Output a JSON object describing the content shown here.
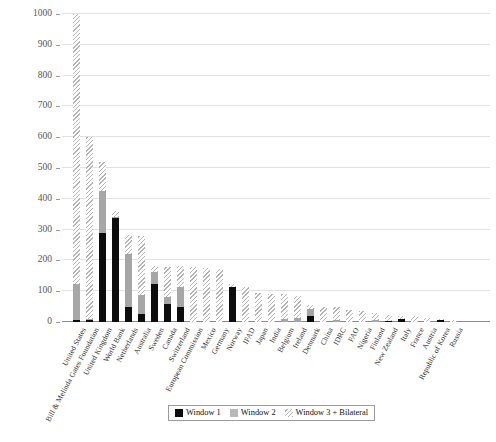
{
  "chart_data": {
    "type": "bar",
    "stacked": true,
    "title": "",
    "subtitle": "",
    "xlabel": "",
    "ylabel": "",
    "ylim": [
      0,
      1000
    ],
    "yticks": [
      0,
      100,
      200,
      300,
      400,
      500,
      600,
      700,
      800,
      900,
      1000
    ],
    "ytick_labels": [
      "0",
      "100",
      "200",
      "300",
      "400",
      "500",
      "600",
      "700",
      "800",
      "900",
      "1000"
    ],
    "grid": "horizontal",
    "legend_position": "bottom",
    "categories": [
      "United States",
      "Bill & Melinda Gates Foundation",
      "United Kingdom",
      "World Bank",
      "Netherlands",
      "Australia",
      "Sweden",
      "Canada",
      "Switzerland",
      "European Commission",
      "Mexico",
      "Germany",
      "Norway",
      "IFAD",
      "Japan",
      "India",
      "Belgium",
      "Ireland",
      "Denmark",
      "China",
      "IDRC",
      "FAO",
      "Nigeria",
      "Finland",
      "New Zealand",
      "Italy",
      "France",
      "Austria",
      "Republic of Korea",
      "Russia"
    ],
    "series": [
      {
        "name": "Window 1",
        "color": "#0d0d0d",
        "values": [
          5,
          8,
          290,
          338,
          48,
          27,
          122,
          60,
          48,
          0,
          0,
          0,
          115,
          0,
          0,
          0,
          0,
          0,
          20,
          0,
          0,
          0,
          0,
          0,
          4,
          10,
          0,
          0,
          5,
          0
        ]
      },
      {
        "name": "Window 2",
        "color": "#a6a6a6",
        "values": [
          118,
          2,
          135,
          3,
          172,
          62,
          42,
          22,
          65,
          0,
          0,
          0,
          0,
          0,
          0,
          0,
          10,
          12,
          22,
          0,
          6,
          0,
          0,
          6,
          0,
          0,
          0,
          0,
          0,
          0
        ]
      },
      {
        "name": "Window 3 + Bilateral",
        "color": "#b4b4b4",
        "hatched": true,
        "values": [
          877,
          590,
          95,
          19,
          62,
          189,
          18,
          96,
          70,
          178,
          175,
          172,
          7,
          115,
          95,
          90,
          80,
          73,
          13,
          48,
          42,
          40,
          37,
          24,
          20,
          8,
          18,
          12,
          5,
          6
        ]
      }
    ],
    "totals": [
      1000,
      600,
      520,
      360,
      282,
      278,
      182,
      178,
      183,
      178,
      175,
      172,
      122,
      115,
      95,
      90,
      90,
      85,
      55,
      48,
      48,
      40,
      37,
      30,
      24,
      18,
      18,
      12,
      10,
      6
    ]
  },
  "legend": {
    "items": [
      {
        "label": "Window 1",
        "swatch": "window-1-swatch"
      },
      {
        "label": "Window 2",
        "swatch": "window-2-swatch"
      },
      {
        "label": "Window 3 + Bilateral",
        "swatch": "window-3-bilateral-swatch"
      }
    ]
  }
}
